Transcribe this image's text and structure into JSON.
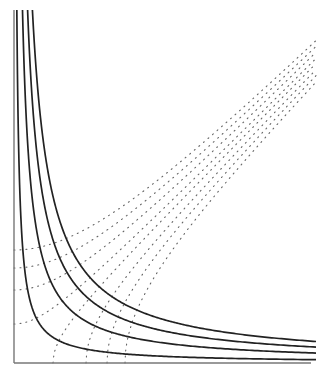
{
  "diagram": {
    "title": "",
    "x_range": [
      0,
      30.2
    ],
    "y_range": [
      0,
      35.3
    ],
    "solid_curves": {
      "equation": "x*y = c",
      "c_values": [
        10,
        30,
        48,
        65
      ],
      "color": "#222222"
    },
    "dotted_curves_right": {
      "equation": "x^2 - y^2 = a^2",
      "vertex_values": [
        3.9,
        7.2,
        9.3,
        11.1
      ],
      "color": "#666666"
    },
    "dotted_curves_up": {
      "equation": "y^2 - x^2 = b^2",
      "vertex_values": [
        3.9,
        7.3,
        9.5,
        11.3
      ],
      "color": "#666666"
    },
    "axes": {
      "color": "#777777",
      "x_label": "",
      "y_label": ""
    }
  }
}
